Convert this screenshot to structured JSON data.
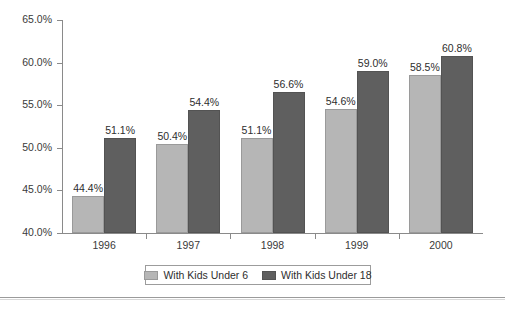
{
  "chart_data": {
    "type": "bar",
    "title": "",
    "subtitle": "",
    "xlabel": "",
    "ylabel": "",
    "categories": [
      "1996",
      "1997",
      "1998",
      "1999",
      "2000"
    ],
    "series": [
      {
        "name": "With Kids Under 6",
        "color": "#b6b6b6",
        "values": [
          44.4,
          50.4,
          51.1,
          54.6,
          58.5
        ],
        "labels": [
          "44.4%",
          "50.4%",
          "51.1%",
          "54.6%",
          "58.5%"
        ]
      },
      {
        "name": "With Kids Under 18",
        "color": "#5f5f5f",
        "values": [
          51.1,
          54.4,
          56.6,
          59.0,
          60.8
        ],
        "labels": [
          "51.1%",
          "54.4%",
          "56.6%",
          "59.0%",
          "60.8%"
        ]
      }
    ],
    "ylim": [
      40.0,
      65.0
    ],
    "ytick_values": [
      40.0,
      45.0,
      50.0,
      55.0,
      60.0,
      65.0
    ],
    "ytick_labels": [
      "40.0%",
      "45.0%",
      "50.0%",
      "55.0%",
      "60.0%",
      "65.0%"
    ],
    "grid": false,
    "legend_position": "bottom",
    "value_labels": true
  },
  "legend": {
    "entries": [
      {
        "label": "With Kids Under 6",
        "swatch": "legend-swatch-light-gray"
      },
      {
        "label": "With Kids Under 18",
        "swatch": "legend-swatch-dark-gray"
      }
    ]
  }
}
